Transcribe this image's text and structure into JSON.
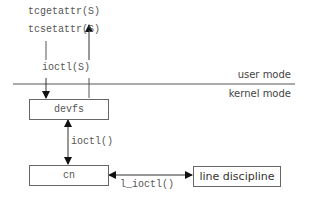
{
  "diagram": {
    "calls": {
      "tcgetattr": "tcgetattr(S)",
      "tcsetattr": "tcsetattr(S)",
      "ioctl_user": "ioctl(S)",
      "ioctl_kernel": "ioctl()",
      "l_ioctl": "l_ioctl()"
    },
    "modes": {
      "user": "user mode",
      "kernel": "kernel mode"
    },
    "boxes": {
      "devfs": "devfs",
      "cn": "cn",
      "line_discipline": "line discipline"
    }
  }
}
